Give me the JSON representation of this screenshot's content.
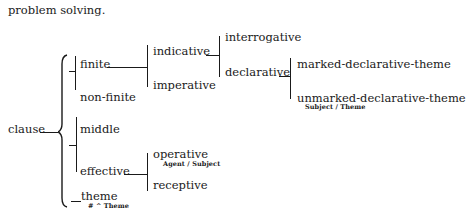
{
  "preceding_text": "problem solving.",
  "network": {
    "root": "clause",
    "systems": {
      "finiteness": {
        "options": [
          "finite",
          "non-finite"
        ]
      },
      "mood": {
        "entry": "finite",
        "options": [
          "indicative",
          "imperative"
        ]
      },
      "indicative_type": {
        "entry": "indicative",
        "options": [
          "interrogative",
          "declarative"
        ]
      },
      "declarative_theme": {
        "entry": "declarative",
        "options": [
          "marked-declarative-theme",
          "unmarked-declarative-theme"
        ],
        "realization": "Subject / Theme"
      },
      "agency": {
        "options": [
          "middle",
          "effective"
        ]
      },
      "voice": {
        "entry": "effective",
        "options": [
          "operative",
          "receptive"
        ],
        "realization": "Agent / Subject"
      },
      "theme": {
        "label": "theme",
        "realization": "# ^ Theme"
      }
    }
  }
}
